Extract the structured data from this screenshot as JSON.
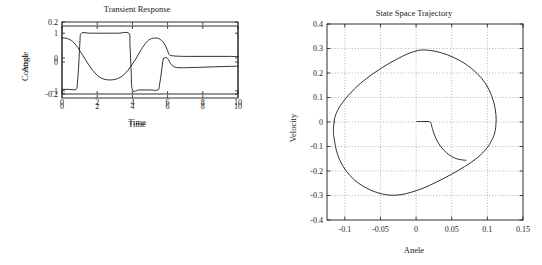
{
  "figure": {
    "panels": [
      "control",
      "angle",
      "phase"
    ]
  },
  "chart_data": [
    {
      "type": "line",
      "name": "control",
      "title": "Transient Response",
      "xlabel": "Time",
      "ylabel": "Control",
      "xlim": [
        0,
        10
      ],
      "ylim": [
        -1.25,
        1.25
      ],
      "xticks": [
        0,
        2,
        4,
        6,
        8,
        10
      ],
      "xticklabels": [
        "0",
        "2",
        "4",
        "6",
        "8",
        "10"
      ],
      "yticks": [
        -1,
        0,
        1
      ],
      "yticklabels": [
        "-1",
        "0",
        "1"
      ],
      "grid": false,
      "series": [
        {
          "name": "u(t)",
          "x": [
            0,
            0.4,
            0.8,
            0.88,
            0.95,
            1.02,
            1.1,
            1.6,
            2.4,
            3.2,
            3.8,
            3.86,
            3.93,
            4.0,
            4.4,
            5.0,
            5.45,
            5.55,
            5.65,
            5.75,
            5.85,
            5.95,
            6.05,
            6.15,
            6.3,
            6.5,
            6.8,
            7.2,
            7.8,
            8.4,
            9.0,
            9.5,
            10
          ],
          "y": [
            -0.95,
            -0.95,
            -0.95,
            -0.7,
            -0.1,
            0.7,
            1.0,
            1.0,
            1.0,
            1.0,
            1.0,
            0.6,
            -0.3,
            -0.97,
            -0.97,
            -0.97,
            -0.97,
            -0.75,
            -0.35,
            0.1,
            0.14,
            0.15,
            0.08,
            -0.04,
            -0.14,
            -0.19,
            -0.2,
            -0.195,
            -0.185,
            -0.172,
            -0.16,
            -0.152,
            -0.145
          ]
        }
      ]
    },
    {
      "type": "line",
      "name": "angle",
      "title": "",
      "xlabel": "Time",
      "ylabel": "Angle",
      "xlim": [
        0,
        10
      ],
      "ylim": [
        -0.2,
        0.2
      ],
      "xticks": [
        0,
        2,
        4,
        6,
        8,
        10
      ],
      "xticklabels": [
        "0",
        "2",
        "4",
        "6",
        "8",
        "10"
      ],
      "yticks": [
        -0.2,
        0,
        0.2
      ],
      "yticklabels": [
        "-0.2",
        "0",
        "0.2"
      ],
      "grid": false,
      "series": [
        {
          "name": "theta(t)",
          "x": [
            0,
            0.3,
            0.6,
            0.9,
            1.2,
            1.5,
            1.8,
            2.1,
            2.4,
            2.7,
            3.0,
            3.3,
            3.6,
            3.9,
            4.2,
            4.5,
            4.8,
            5.0,
            5.2,
            5.5,
            5.8,
            6.0,
            6.1,
            6.3,
            6.6,
            7.0,
            7.5,
            8.0,
            8.5,
            9.0,
            9.5,
            10
          ],
          "y": [
            0.112,
            0.108,
            0.092,
            0.058,
            0.012,
            -0.035,
            -0.075,
            -0.104,
            -0.118,
            -0.122,
            -0.119,
            -0.108,
            -0.085,
            -0.048,
            -0.004,
            0.047,
            0.088,
            0.104,
            0.11,
            0.108,
            0.082,
            0.04,
            0.018,
            0.012,
            0.01,
            0.009,
            0.009,
            0.009,
            0.009,
            0.009,
            0.009,
            0.008
          ]
        }
      ]
    },
    {
      "type": "line",
      "name": "phase",
      "title": "State Space Trajectory",
      "xlabel": "Anele",
      "ylabel": "Velocity",
      "xlim": [
        -0.125,
        0.15
      ],
      "ylim": [
        -0.4,
        0.4
      ],
      "xticks": [
        -0.1,
        -0.05,
        0,
        0.05,
        0.1,
        0.15
      ],
      "xticklabels": [
        "-0.1",
        "-0.05",
        "0",
        "0.05",
        "0.1",
        "0.15"
      ],
      "yticks": [
        -0.4,
        -0.3,
        -0.2,
        -0.1,
        0,
        0.1,
        0.2,
        0.3,
        0.4
      ],
      "yticklabels": [
        "-0.4",
        "-0.3",
        "-0.2",
        "-0.1",
        "0",
        "0.1",
        "0.2",
        "0.3",
        "0.4"
      ],
      "grid": true,
      "series": [
        {
          "name": "loop",
          "x": [
            -0.115,
            -0.113,
            -0.106,
            -0.094,
            -0.078,
            -0.06,
            -0.042,
            -0.026,
            -0.012,
            0.0,
            0.008,
            0.016,
            0.028,
            0.044,
            0.062,
            0.078,
            0.092,
            0.102,
            0.109,
            0.112,
            0.112,
            0.109,
            0.1,
            0.086,
            0.068,
            0.048,
            0.028,
            0.01,
            -0.006,
            -0.02,
            -0.034,
            -0.05,
            -0.068,
            -0.086,
            -0.1,
            -0.11,
            -0.115,
            -0.116,
            -0.115
          ],
          "y": [
            0.0,
            0.028,
            0.068,
            0.112,
            0.158,
            0.198,
            0.232,
            0.258,
            0.278,
            0.29,
            0.294,
            0.293,
            0.288,
            0.274,
            0.25,
            0.218,
            0.178,
            0.134,
            0.08,
            0.03,
            -0.012,
            -0.056,
            -0.104,
            -0.146,
            -0.182,
            -0.216,
            -0.246,
            -0.27,
            -0.286,
            -0.296,
            -0.299,
            -0.292,
            -0.272,
            -0.238,
            -0.192,
            -0.134,
            -0.068,
            -0.03,
            0.0
          ]
        },
        {
          "name": "tail",
          "x": [
            0.001,
            0.008,
            0.014,
            0.019,
            0.021,
            0.022,
            0.024,
            0.028,
            0.034,
            0.042,
            0.05,
            0.058,
            0.065,
            0.07
          ],
          "y": [
            0.002,
            0.002,
            0.002,
            0.001,
            -0.006,
            -0.018,
            -0.038,
            -0.068,
            -0.098,
            -0.124,
            -0.141,
            -0.151,
            -0.155,
            -0.156
          ]
        }
      ]
    }
  ]
}
